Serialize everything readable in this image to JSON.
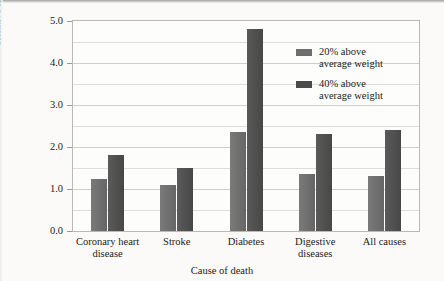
{
  "chart_data": {
    "type": "bar",
    "title": "",
    "xlabel": "Cause of death",
    "ylabel": "Relative risk (1.0 = normal)",
    "categories": [
      "Coronary heart\ndisease",
      "Stroke",
      "Diabetes",
      "Digestive\ndiseases",
      "All causes"
    ],
    "series": [
      {
        "name": "20% above\naverage weight",
        "color": "#6e6e6e",
        "values": [
          1.25,
          1.1,
          2.35,
          1.35,
          1.3
        ]
      },
      {
        "name": "40% above\naverage weight",
        "color": "#4a4a4a",
        "values": [
          1.8,
          1.5,
          4.8,
          2.3,
          2.4
        ]
      }
    ],
    "ylim": [
      0.0,
      5.0
    ],
    "yticks": [
      "0.0",
      "1.0",
      "2.0",
      "3.0",
      "4.0",
      "5.0"
    ],
    "ytick_values": [
      0.0,
      1.0,
      2.0,
      3.0,
      4.0,
      5.0
    ],
    "gridlines": [
      0.5,
      1.5,
      2.5,
      3.5,
      4.5
    ],
    "grid": true,
    "legend_position": "upper right"
  },
  "legend": {
    "entries": [
      {
        "label": "20% above\naverage weight"
      },
      {
        "label": "40% above\naverage weight"
      }
    ]
  },
  "axes": {
    "y_title": "Relative risk (1.0 = normal)",
    "x_title": "Cause of death"
  },
  "colors": {
    "series_20": "#6e6e6e",
    "series_40": "#4a4a4a",
    "frame": "#b9b9b5",
    "grid": "#ddddd9",
    "page_background": "#fbfaf8"
  }
}
